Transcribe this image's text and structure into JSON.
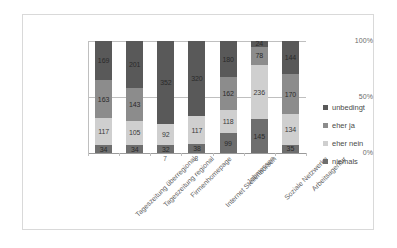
{
  "chart_data": {
    "type": "bar",
    "variant": "100% stacked column",
    "title": "",
    "xlabel": "",
    "ylabel": "",
    "ylim": [
      0,
      100
    ],
    "ytick_labels": [
      "0%",
      "50%",
      "100%"
    ],
    "ytick_values": [
      0,
      50,
      100
    ],
    "grid": true,
    "legend_position": "right",
    "stack_order_bottom_to_top": [
      "niemals",
      "eher nein",
      "eher ja",
      "unbedingt"
    ],
    "categories": [
      "Tageszeitung überregional",
      "Tageszeitung regional",
      "Firmenhomepage",
      "Internet Stellenbörsen",
      "Jobmessen",
      "Soziale Netzwerke",
      "Arbeitsagentur"
    ],
    "series": [
      {
        "name": "unbedingt",
        "color": "#595959",
        "values": [
          169,
          201,
          352,
          320,
          180,
          24,
          144
        ]
      },
      {
        "name": "eher ja",
        "color": "#8c8c8c",
        "values": [
          163,
          143,
          0,
          0,
          162,
          78,
          170
        ]
      },
      {
        "name": "eher nein",
        "color": "#cfcfcf",
        "values": [
          117,
          105,
          92,
          117,
          118,
          236,
          134
        ]
      },
      {
        "name": "niemals",
        "color": "#6e6e6e",
        "values": [
          34,
          34,
          32,
          38,
          99,
          145,
          35
        ]
      }
    ],
    "data_labels": [
      [
        "169",
        "163",
        "117",
        "34"
      ],
      [
        "201",
        "143",
        "105",
        "34"
      ],
      [
        "352",
        "",
        "92",
        "32"
      ],
      [
        "320",
        "",
        "117",
        "38"
      ],
      [
        "180",
        "162",
        "118",
        "99"
      ],
      [
        "24",
        "78",
        "236",
        "145"
      ],
      [
        "144",
        "170",
        "134",
        "35"
      ]
    ],
    "axis_sub_numbers": [
      "",
      "",
      "7",
      "8",
      "",
      "",
      ""
    ]
  },
  "legend": {
    "items": [
      {
        "label": "unbedingt",
        "color": "#595959"
      },
      {
        "label": "eher ja",
        "color": "#8c8c8c"
      },
      {
        "label": "eher nein",
        "color": "#cfcfcf"
      },
      {
        "label": "niemals",
        "color": "#6e6e6e"
      }
    ]
  },
  "axes": {
    "y_ticks": [
      "100%",
      "50%",
      "0%"
    ]
  }
}
